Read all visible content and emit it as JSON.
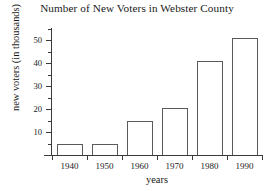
{
  "chart_data": {
    "type": "bar",
    "title": "Number of New Voters in Webster County",
    "xlabel": "years",
    "ylabel": "new voters (in thousands)",
    "categories": [
      "1940",
      "1950",
      "1960",
      "1970",
      "1980",
      "1990"
    ],
    "values": [
      5,
      5,
      15,
      20.5,
      41,
      51
    ],
    "ylim": [
      0,
      55
    ],
    "xlim_note": "categorical bars, evenly spaced",
    "y_major_ticks": [
      10,
      20,
      30,
      40,
      50
    ],
    "y_minor_ticks": [
      5,
      15,
      25,
      35,
      45,
      55
    ],
    "y_tick_labels": [
      "10",
      "20",
      "30",
      "40",
      "50"
    ],
    "grid": false,
    "legend": "none",
    "bar_fill_color": "#ffffff",
    "bar_border_color": "#5a5a5a",
    "axis_color": "#3a3a3a",
    "text_color": "#1a1a1a",
    "background_color": "#ffffff"
  },
  "axes": {
    "y_ticks": [
      {
        "label": "50",
        "value": 50
      },
      {
        "label": "40",
        "value": 40
      },
      {
        "label": "30",
        "value": 30
      },
      {
        "label": "20",
        "value": 20
      },
      {
        "label": "10",
        "value": 10
      }
    ],
    "x_ticks": [
      {
        "label": "1940",
        "value": 5
      },
      {
        "label": "1950",
        "value": 5
      },
      {
        "label": "1960",
        "value": 15
      },
      {
        "label": "1970",
        "value": 20.5
      },
      {
        "label": "1980",
        "value": 41
      },
      {
        "label": "1990",
        "value": 51
      }
    ]
  }
}
